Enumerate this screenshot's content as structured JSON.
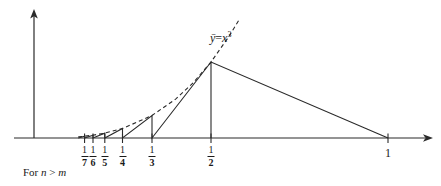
{
  "figure": {
    "title": "",
    "curve_label": {
      "lhs": "ȳ",
      "eq": "=",
      "base": "x",
      "exponent": "3",
      "full": "ȳ = x³"
    },
    "caption": "For n > m",
    "caption_parts": {
      "prefix": "For ",
      "n": "n",
      "rel": " > ",
      "m": "m"
    },
    "colors": {
      "ink": "#1a1a1a",
      "axis": "#2a2a2a",
      "dashed": "#2a2a2a"
    }
  },
  "chart_data": {
    "type": "line",
    "title": "",
    "xlabel": "",
    "ylabel": "",
    "xlim": [
      0,
      1.125
    ],
    "ylim": [
      0,
      0.72
    ],
    "grid": false,
    "legend": null,
    "annotations": [
      {
        "text": "ȳ = x³",
        "x": 0.54,
        "y": 0.6
      },
      {
        "text": "For n > m",
        "x": 0.02,
        "y": -0.17
      }
    ],
    "xticks": [
      {
        "value": 0.142857,
        "label": "1/7",
        "num": "1",
        "den": "7"
      },
      {
        "value": 0.166667,
        "label": "1/6",
        "num": "1",
        "den": "6"
      },
      {
        "value": 0.2,
        "label": "1/5",
        "num": "1",
        "den": "5"
      },
      {
        "value": 0.25,
        "label": "1/4",
        "num": "1",
        "den": "4"
      },
      {
        "value": 0.333333,
        "label": "1/3",
        "num": "1",
        "den": "3"
      },
      {
        "value": 0.5,
        "label": "1/2",
        "num": "1",
        "den": "2"
      },
      {
        "value": 1.0,
        "label": "1",
        "num": "1",
        "den": ""
      }
    ],
    "series": [
      {
        "name": "sawtooth",
        "style": "solid",
        "points": [
          [
            0.125,
            0.0
          ],
          [
            0.142857,
            0.00291
          ],
          [
            0.142857,
            0.0
          ],
          [
            0.142857,
            0.0
          ],
          [
            0.166667,
            0.00463
          ],
          [
            0.166667,
            0.0
          ],
          [
            0.166667,
            0.0
          ],
          [
            0.2,
            0.008
          ],
          [
            0.2,
            0.0
          ],
          [
            0.2,
            0.0
          ],
          [
            0.25,
            0.0156
          ],
          [
            0.25,
            0.0
          ],
          [
            0.25,
            0.0
          ],
          [
            0.333333,
            0.037
          ],
          [
            0.333333,
            0.0
          ],
          [
            0.333333,
            0.0
          ],
          [
            0.5,
            0.125
          ],
          [
            0.5,
            0.0
          ],
          [
            0.5,
            0.125
          ],
          [
            1.0,
            0.0
          ]
        ]
      },
      {
        "name": "envelope y-bar = x^3",
        "style": "dashed",
        "points": [
          [
            0.125,
            0.00195
          ],
          [
            0.142857,
            0.00291
          ],
          [
            0.166667,
            0.00463
          ],
          [
            0.2,
            0.008
          ],
          [
            0.25,
            0.0156
          ],
          [
            0.333333,
            0.037
          ],
          [
            0.4,
            0.064
          ],
          [
            0.45,
            0.0911
          ],
          [
            0.5,
            0.125
          ],
          [
            0.55,
            0.1664
          ],
          [
            0.58,
            0.195
          ]
        ]
      }
    ]
  }
}
